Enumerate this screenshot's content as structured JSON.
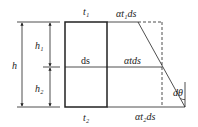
{
  "diagram": {
    "labels": {
      "t1": "t₁",
      "t2": "t₂",
      "h": "h",
      "h1": "h₁",
      "h2": "h₂",
      "ds": "ds",
      "alpha_t1_ds": "αt₁ds",
      "alpha_t_ds": "αtds",
      "alpha_t2_ds": "αt₂ds",
      "dtheta": "dθ"
    },
    "colors": {
      "line": "#222222",
      "background": "#ffffff"
    }
  }
}
